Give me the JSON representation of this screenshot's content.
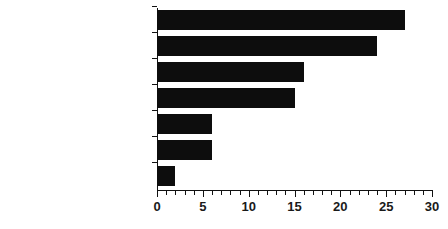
{
  "chart_data": {
    "type": "bar",
    "orientation": "horizontal",
    "title": "",
    "xlabel": "",
    "ylabel": "",
    "xlim": [
      0,
      30
    ],
    "grid": false,
    "legend": null,
    "x_major_step": 5,
    "x_minor_step": 1,
    "xticks": [
      "0",
      "5",
      "10",
      "15",
      "20",
      "25",
      "30"
    ],
    "categories": [
      "Supplier",
      "Quality",
      "Fabrication",
      "Operation",
      "Material Shortage",
      "Miscellaneous",
      "Engineering Changes"
    ],
    "values": [
      27,
      24,
      16,
      15,
      6,
      6,
      2
    ],
    "bar_color": "#0d0d0d",
    "axis_color": "#111111",
    "background_color": "#ffffff"
  }
}
